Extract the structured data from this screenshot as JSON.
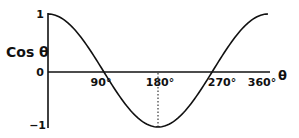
{
  "chart_data": {
    "type": "line",
    "title": "",
    "xlabel": "θ",
    "ylabel": "Cos θ",
    "x_ticks": [
      "90°",
      "180°",
      "270°",
      "360°"
    ],
    "x_tick_values": [
      90,
      180,
      270,
      360
    ],
    "y_ticks": [
      "1",
      "0",
      "−1"
    ],
    "y_tick_values": [
      1,
      0,
      -1
    ],
    "xlim": [
      0,
      360
    ],
    "ylim": [
      -1,
      1
    ],
    "grid": false,
    "legend": null,
    "series": [
      {
        "name": "cos θ",
        "x": [
          0,
          30,
          60,
          90,
          120,
          150,
          180,
          210,
          240,
          270,
          300,
          330,
          360
        ],
        "values": [
          1,
          0.866,
          0.5,
          0,
          -0.5,
          -0.866,
          -1,
          -0.866,
          -0.5,
          0,
          0.5,
          0.866,
          1
        ]
      }
    ],
    "annotations": [
      {
        "type": "dotted-vertical-line",
        "x": 180,
        "from_y": 0,
        "to_y": -1
      }
    ]
  },
  "labels": {
    "y_axis": "Cos θ",
    "x_axis": "θ",
    "y_top": "1",
    "y_zero": "0",
    "y_bottom": "−1",
    "x_90": "90°",
    "x_180": "180°",
    "x_270": "270°",
    "x_360": "360°"
  },
  "colors": {
    "line": "#111111",
    "background": "#ffffff"
  }
}
